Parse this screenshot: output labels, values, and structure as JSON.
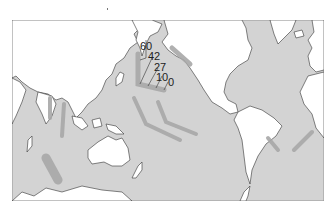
{
  "map": {
    "type": "world-map-pacific-centered",
    "colors": {
      "ocean": "#d3d3d3",
      "land": "#ffffff",
      "coastline": "#333333",
      "track": "#a8a8a8",
      "frame": "#888888"
    },
    "hotspot_track": {
      "name": "hawaiian-emperor-chain",
      "age_labels": [
        "60",
        "42",
        "27",
        "10",
        "0"
      ]
    },
    "other_tracks_count": 8
  }
}
